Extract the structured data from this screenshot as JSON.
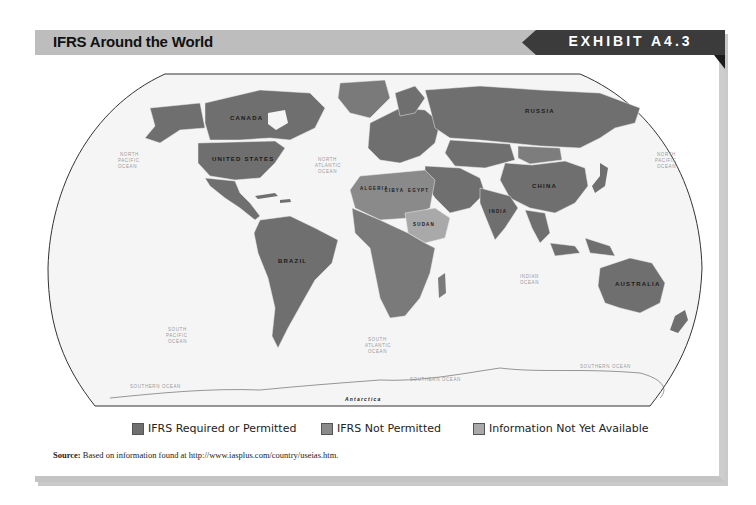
{
  "header": {
    "title": "IFRS Around the World",
    "exhibit_label": "EXHIBIT A4.3"
  },
  "map": {
    "country_labels": {
      "canada": "CANADA",
      "united_states": "UNITED STATES",
      "brazil": "BRAZIL",
      "russia": "RUSSIA",
      "china": "CHINA",
      "australia": "AUSTRALIA",
      "algeria": "ALGERIA",
      "libya": "LIBYA",
      "egypt": "EGYPT",
      "sudan": "SUDAN",
      "india": "INDIA",
      "antarctica": "Antarctica"
    },
    "ocean_labels": {
      "north_pacific_w": [
        "NORTH",
        "PACIFIC",
        "OCEAN"
      ],
      "north_atlantic": [
        "NORTH",
        "ATLANTIC",
        "OCEAN"
      ],
      "north_pacific_e": [
        "NORTH",
        "PACIFIC",
        "OCEAN"
      ],
      "south_pacific": [
        "SOUTH",
        "PACIFIC",
        "OCEAN"
      ],
      "south_atlantic": [
        "SOUTH",
        "ATLANTIC",
        "OCEAN"
      ],
      "indian": [
        "INDIAN",
        "OCEAN"
      ],
      "southern_w": "SOUTHERN OCEAN",
      "southern_c": "SOUTHERN OCEAN",
      "southern_e": "SOUTHERN OCEAN"
    },
    "colors": {
      "required_or_permitted": "#6f6f6f",
      "not_permitted": "#8a8a8a",
      "not_yet_available": "#a9a9a9",
      "ocean": "#f4f4f4",
      "outline": "#333333"
    }
  },
  "legend": {
    "items": [
      {
        "label": "IFRS Required or Permitted",
        "color": "#6f6f6f"
      },
      {
        "label": "IFRS Not Permitted",
        "color": "#8a8a8a"
      },
      {
        "label": "Information Not Yet Available",
        "color": "#a9a9a9"
      }
    ]
  },
  "source": {
    "prefix": "Source:",
    "text": " Based on information found at http://www.iasplus.com/country/useias.htm."
  }
}
